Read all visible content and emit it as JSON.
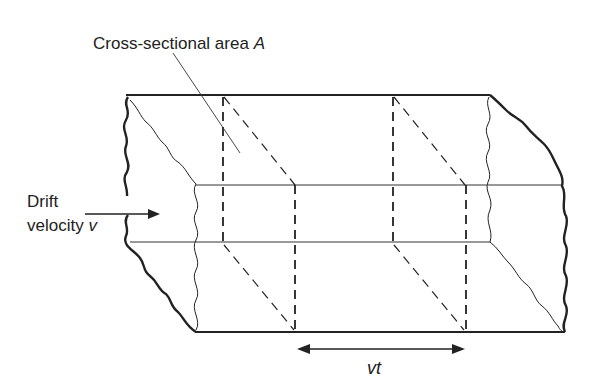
{
  "diagram": {
    "labels": {
      "area": "Cross-sectional area ",
      "area_symbol": "A",
      "drift_line1": "Drift",
      "drift_line2": "velocity ",
      "drift_symbol": "v",
      "distance": "vt"
    },
    "colors": {
      "ink": "#222222",
      "background": "#ffffff"
    }
  }
}
